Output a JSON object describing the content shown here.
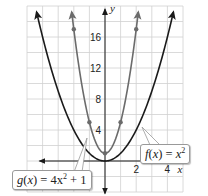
{
  "chart_data": {
    "type": "line",
    "title": "",
    "xlabel": "x",
    "ylabel": "y",
    "xlim": [
      -5,
      5
    ],
    "ylim": [
      -2,
      20
    ],
    "grid": true,
    "x_tick_labels": [
      "2",
      "4"
    ],
    "y_tick_labels": [
      "4",
      "8",
      "12",
      "16"
    ],
    "series": [
      {
        "name": "f(x) = x^2",
        "label_text": {
          "func": "f",
          "arg": "x",
          "rhs_base": "x",
          "rhs_exp": "2",
          "rhs_tail": ""
        },
        "color": "#1a1a1a",
        "equation": "x^2",
        "points_marked": []
      },
      {
        "name": "g(x) = 4x^2 + 1",
        "label_text": {
          "func": "g",
          "arg": "x",
          "rhs_base": "4x",
          "rhs_exp": "2",
          "rhs_tail": " + 1"
        },
        "color": "#6b6b6b",
        "equation": "4x^2 + 1",
        "points_marked": [
          [
            -2,
            17
          ],
          [
            -1,
            5
          ],
          [
            0,
            1
          ],
          [
            1,
            5
          ],
          [
            2,
            17
          ]
        ]
      }
    ]
  },
  "colors": {
    "grid": "#d0d0d0",
    "axis": "#1a1a1a",
    "f_curve": "#1a1a1a",
    "g_curve": "#6b6b6b"
  }
}
